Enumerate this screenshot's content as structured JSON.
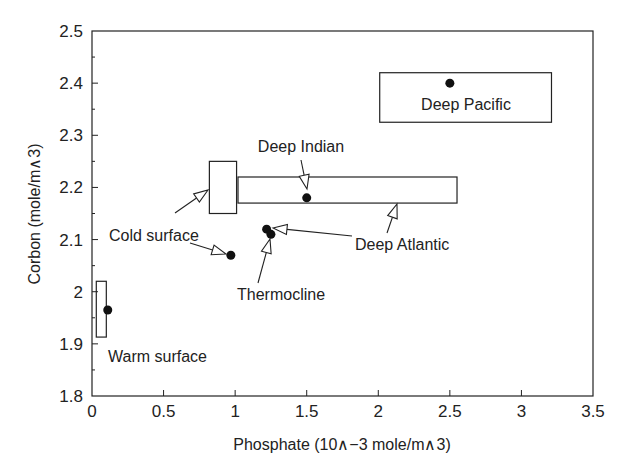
{
  "chart_data": {
    "type": "scatter",
    "title": "",
    "xlabel": "Phosphate (10∧−3 mole/m∧3)",
    "ylabel": "Corbon (mole/m∧3)",
    "xlim": [
      0,
      3.5
    ],
    "ylim": [
      1.8,
      2.5
    ],
    "grid": false,
    "legend": null,
    "x_ticks": [
      0,
      0.5,
      1,
      1.5,
      2,
      2.5,
      3,
      3.5
    ],
    "x_tick_labels": [
      "0",
      "0.5",
      "1",
      "1.5",
      "2",
      "2.5",
      "3",
      "3.5"
    ],
    "y_ticks": [
      1.8,
      1.9,
      2.0,
      2.1,
      2.2,
      2.3,
      2.4,
      2.5
    ],
    "y_tick_labels": [
      "1.8",
      "1.9",
      "2",
      "2.1",
      "2.2",
      "2.3",
      "2.4",
      "2.5"
    ],
    "points": [
      {
        "name": "Warm surface",
        "x": 0.11,
        "y": 1.965
      },
      {
        "name": "Cold surface",
        "x": 0.97,
        "y": 2.07
      },
      {
        "name": "Deep Atlantic",
        "x": 1.22,
        "y": 2.12
      },
      {
        "name": "Thermocline",
        "x": 1.25,
        "y": 2.11
      },
      {
        "name": "Deep Indian",
        "x": 1.5,
        "y": 2.18
      },
      {
        "name": "Deep Pacific",
        "x": 2.5,
        "y": 2.4
      }
    ],
    "ranges": [
      {
        "name": "Warm surface range",
        "x0": 0.03,
        "x1": 0.1,
        "y0": 1.913,
        "y1": 2.02
      },
      {
        "name": "Cold surface range",
        "x0": 0.82,
        "x1": 1.01,
        "y0": 2.15,
        "y1": 2.25
      },
      {
        "name": "Deep Indian / Atlantic range",
        "x0": 1.02,
        "x1": 2.55,
        "y0": 2.17,
        "y1": 2.22
      },
      {
        "name": "Deep Pacific range",
        "x0": 2.01,
        "x1": 3.21,
        "y0": 2.325,
        "y1": 2.42
      }
    ],
    "annotations": [
      {
        "text": "Deep Pacific",
        "x": 2.95,
        "y": 2.365
      },
      {
        "text": "Deep Indian",
        "x": 1.6,
        "y": 2.265
      },
      {
        "text": "Cold surface",
        "x": 0.43,
        "y": 2.1
      },
      {
        "text": "Deep Atlantic",
        "x": 1.98,
        "y": 2.095
      },
      {
        "text": "Thermocline",
        "x": 1.52,
        "y": 2.01
      },
      {
        "text": "Warm surface",
        "x": 0.55,
        "y": 1.88
      }
    ]
  },
  "labels": {
    "xlabel": "Phosphate (10∧−3 mole/m∧3)",
    "ylabel": "Corbon (mole/m∧3)",
    "deep_pacific": "Deep Pacific",
    "deep_indian": "Deep Indian",
    "cold_surface": "Cold surface",
    "deep_atlantic": "Deep Atlantic",
    "thermocline": "Thermocline",
    "warm_surface": "Warm surface"
  }
}
